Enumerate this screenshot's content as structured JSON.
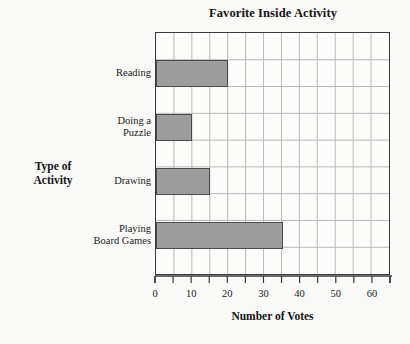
{
  "chart_data": {
    "type": "bar",
    "orientation": "horizontal",
    "title": "Favorite Inside Activity",
    "xlabel": "Number of Votes",
    "ylabel": "Type of\nActivity",
    "categories": [
      "Reading",
      "Doing a\nPuzzle",
      "Drawing",
      "Playing\nBoard Games"
    ],
    "values": [
      20,
      10,
      15,
      35
    ],
    "xlim": [
      0,
      65
    ],
    "ylim": [
      0,
      4
    ],
    "x_tick_labels": [
      "0",
      "10",
      "20",
      "30",
      "40",
      "50",
      "60"
    ],
    "x_tick_values": [
      0,
      10,
      20,
      30,
      40,
      50,
      60
    ],
    "x_minor_tick_values": [
      5,
      15,
      25,
      35,
      45,
      55,
      65
    ],
    "grid": true,
    "grid_step": 5,
    "legend": null,
    "bar_color": "#9d9d9d",
    "bar_edge_color": "#4a4a4a",
    "grid_color": "#b9b9b9",
    "axis_color": "#3a3a3a",
    "background_color": "#f9f9f7",
    "plot_background_color": "#fcfcfa"
  }
}
